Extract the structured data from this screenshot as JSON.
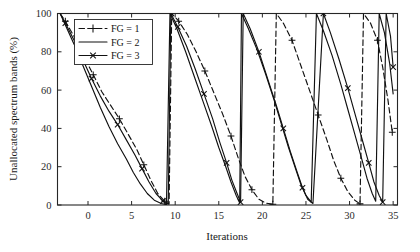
{
  "figure": {
    "background": "#ffffff",
    "ink": "#111111"
  },
  "chart_data": {
    "type": "line",
    "title": "",
    "subtitle": "",
    "xlabel": "Iterations",
    "ylabel": "Unallocated spectrum bands (%)",
    "xlim": [
      -3.5,
      35.5
    ],
    "ylim": [
      0,
      100
    ],
    "xticks": [
      0,
      5,
      10,
      15,
      20,
      25,
      30,
      35
    ],
    "xtick_labels": [
      "0",
      "5",
      "10",
      "15",
      "20",
      "25",
      "30",
      "35"
    ],
    "yticks": [
      0,
      20,
      40,
      60,
      80,
      100
    ],
    "ytick_labels": [
      "0",
      "20",
      "40",
      "60",
      "80",
      "100"
    ],
    "grid": false,
    "legend_position": "upper-left-inset",
    "annotations": [],
    "series": [
      {
        "name": "FG = 1",
        "label": "FG = 1",
        "linestyle": "dashed",
        "marker": "plus",
        "color": "#111111",
        "points": [
          [
            -3.2,
            100
          ],
          [
            -2.6,
            96
          ],
          [
            -1.6,
            88
          ],
          [
            -0.4,
            77
          ],
          [
            0.6,
            68
          ],
          [
            1.6,
            59
          ],
          [
            2.6,
            52
          ],
          [
            3.6,
            45
          ],
          [
            4.6,
            37
          ],
          [
            5.6,
            29
          ],
          [
            6.4,
            21
          ],
          [
            7.2,
            13
          ],
          [
            8.0,
            6
          ],
          [
            8.8,
            2
          ],
          [
            9.3,
            0.5
          ],
          [
            9.6,
            100
          ],
          [
            10.4,
            96
          ],
          [
            11.4,
            89
          ],
          [
            12.4,
            80
          ],
          [
            13.4,
            70
          ],
          [
            14.4,
            59
          ],
          [
            15.4,
            48
          ],
          [
            16.4,
            36
          ],
          [
            17.2,
            25
          ],
          [
            18.0,
            15
          ],
          [
            18.8,
            8
          ],
          [
            19.6,
            3
          ],
          [
            20.4,
            1
          ],
          [
            21.2,
            0.4
          ],
          [
            21.6,
            100
          ],
          [
            22.4,
            95
          ],
          [
            23.4,
            86
          ],
          [
            24.4,
            73
          ],
          [
            25.4,
            60
          ],
          [
            26.4,
            47
          ],
          [
            27.4,
            34
          ],
          [
            28.2,
            23
          ],
          [
            29.0,
            14
          ],
          [
            29.8,
            7
          ],
          [
            30.6,
            2.5
          ],
          [
            31.2,
            0.6
          ],
          [
            31.6,
            100
          ],
          [
            32.4,
            95
          ],
          [
            33.2,
            86
          ],
          [
            33.8,
            72
          ],
          [
            34.4,
            55
          ],
          [
            34.9,
            38
          ]
        ]
      },
      {
        "name": "FG = 2",
        "label": "FG = 2",
        "linestyle": "solid",
        "marker": "none",
        "color": "#111111",
        "points": [
          [
            -3.2,
            100
          ],
          [
            -2.6,
            94
          ],
          [
            -1.6,
            84
          ],
          [
            -0.6,
            73
          ],
          [
            0.4,
            62
          ],
          [
            1.4,
            51
          ],
          [
            2.4,
            41
          ],
          [
            3.4,
            32
          ],
          [
            4.4,
            24
          ],
          [
            5.2,
            17
          ],
          [
            6.0,
            11
          ],
          [
            6.8,
            6
          ],
          [
            7.6,
            2.5
          ],
          [
            8.4,
            0.8
          ],
          [
            9.0,
            0.2
          ],
          [
            9.4,
            100
          ],
          [
            10.2,
            92
          ],
          [
            11.2,
            80
          ],
          [
            12.2,
            67
          ],
          [
            13.2,
            54
          ],
          [
            14.2,
            41
          ],
          [
            15.0,
            30
          ],
          [
            15.8,
            20
          ],
          [
            16.4,
            12
          ],
          [
            17.0,
            5
          ],
          [
            17.4,
            1
          ],
          [
            17.6,
            100
          ],
          [
            18.4,
            92
          ],
          [
            19.4,
            81
          ],
          [
            20.4,
            68
          ],
          [
            21.4,
            54
          ],
          [
            22.2,
            42
          ],
          [
            23.0,
            30
          ],
          [
            23.8,
            19
          ],
          [
            24.4,
            11
          ],
          [
            25.0,
            5
          ],
          [
            25.6,
            1.5
          ],
          [
            26.2,
            100
          ],
          [
            27.0,
            91
          ],
          [
            28.0,
            78
          ],
          [
            29.0,
            63
          ],
          [
            29.8,
            50
          ],
          [
            30.6,
            37
          ],
          [
            31.4,
            24
          ],
          [
            32.0,
            14
          ],
          [
            32.6,
            6
          ],
          [
            33.0,
            2
          ],
          [
            33.4,
            100
          ],
          [
            34.0,
            90
          ],
          [
            34.6,
            74
          ],
          [
            35.0,
            58
          ]
        ]
      },
      {
        "name": "FG = 3",
        "label": "FG = 3",
        "linestyle": "solid",
        "marker": "cross",
        "color": "#111111",
        "points": [
          [
            -3.2,
            100
          ],
          [
            -2.6,
            95
          ],
          [
            -1.6,
            86
          ],
          [
            -0.6,
            76
          ],
          [
            0.4,
            66
          ],
          [
            1.4,
            57
          ],
          [
            2.4,
            49
          ],
          [
            3.4,
            42
          ],
          [
            4.4,
            34
          ],
          [
            5.4,
            26
          ],
          [
            6.2,
            19
          ],
          [
            7.0,
            12
          ],
          [
            7.8,
            6
          ],
          [
            8.6,
            2
          ],
          [
            9.2,
            0.4
          ],
          [
            9.5,
            100
          ],
          [
            10.3,
            93
          ],
          [
            11.3,
            83
          ],
          [
            12.3,
            71
          ],
          [
            13.3,
            58
          ],
          [
            14.3,
            45
          ],
          [
            15.1,
            33
          ],
          [
            15.9,
            22
          ],
          [
            16.5,
            13
          ],
          [
            17.1,
            6
          ],
          [
            17.5,
            1.5
          ],
          [
            17.8,
            100
          ],
          [
            18.6,
            92
          ],
          [
            19.6,
            80
          ],
          [
            20.6,
            66
          ],
          [
            21.6,
            52
          ],
          [
            22.4,
            40
          ],
          [
            23.2,
            28
          ],
          [
            24.0,
            17
          ],
          [
            24.6,
            9
          ],
          [
            25.2,
            3
          ],
          [
            25.8,
            0.8
          ],
          [
            27.0,
            100
          ],
          [
            27.8,
            90
          ],
          [
            28.8,
            76
          ],
          [
            29.8,
            61
          ],
          [
            30.6,
            48
          ],
          [
            31.4,
            35
          ],
          [
            32.2,
            22
          ],
          [
            32.8,
            12
          ],
          [
            33.4,
            5
          ],
          [
            33.8,
            1.5
          ],
          [
            34.2,
            100
          ],
          [
            34.7,
            88
          ],
          [
            35.0,
            72
          ]
        ]
      }
    ]
  },
  "legend": {
    "items": [
      {
        "label": "FG = 1"
      },
      {
        "label": "FG = 2"
      },
      {
        "label": "FG = 3"
      }
    ]
  }
}
